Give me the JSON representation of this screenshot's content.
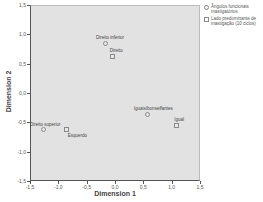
{
  "chart_data": {
    "type": "scatter",
    "title": "",
    "xlabel": "Dimension 1",
    "ylabel": "Dimension 2",
    "xlim": [
      -1.5,
      1.5
    ],
    "ylim": [
      -1.5,
      1.5
    ],
    "xticks": [
      "-1,5",
      "-1,0",
      "-0,5",
      "0,0",
      "0,5",
      "1,0",
      "1,5"
    ],
    "yticks": [
      "1,5",
      "1,0",
      "0,5",
      "0,0",
      "-0,5",
      "-1,0",
      "-1,5"
    ],
    "grid": false,
    "legend_position": "right",
    "series": [
      {
        "name": "Ângulos funcionais mastigatórios",
        "marker": "circle",
        "points": [
          {
            "label": "Direito inferior",
            "x": -0.16,
            "y": 0.85
          },
          {
            "label": "Direito superior",
            "x": -1.27,
            "y": -0.63
          },
          {
            "label": "Iguais/bonseffantes",
            "x": 0.58,
            "y": -0.36
          }
        ]
      },
      {
        "name": "Lado predominante de mastigação (10 ciclos)",
        "marker": "square",
        "points": [
          {
            "label": "Direito",
            "x": -0.04,
            "y": 0.63
          },
          {
            "label": "Esquerdo",
            "x": -0.85,
            "y": -0.63
          },
          {
            "label": "Igual",
            "x": 1.08,
            "y": -0.55
          }
        ]
      }
    ]
  },
  "legend": {
    "items": [
      {
        "label": "Ângulos funcionais mastigatórios",
        "marker": "circle"
      },
      {
        "label": "Lado predominante de mastigação (10 ciclos)",
        "marker": "square"
      }
    ]
  },
  "colors": {
    "plot_background": "#e2e2e2",
    "axis": "#555555",
    "marker_border": "#888888"
  }
}
